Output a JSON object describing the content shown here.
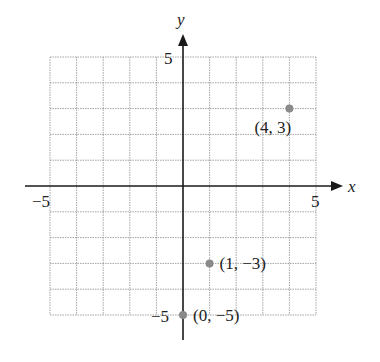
{
  "chart_data": {
    "type": "scatter",
    "title": "",
    "xlabel": "x",
    "ylabel": "y",
    "xlim": [
      -5,
      5
    ],
    "ylim": [
      -5,
      5
    ],
    "grid": true,
    "x_ticks_labeled": [
      "-5",
      "5"
    ],
    "y_ticks_labeled": [
      "5",
      "-5"
    ],
    "points": [
      {
        "x": 4,
        "y": 3,
        "label": "(4, 3)"
      },
      {
        "x": 1,
        "y": -3,
        "label": "(1, −3)"
      },
      {
        "x": 0,
        "y": -5,
        "label": "(0, −5)"
      }
    ]
  },
  "axes": {
    "x_label": "x",
    "y_label": "y",
    "x_min_label": "−5",
    "x_max_label": "5",
    "y_max_label": "5",
    "y_min_label": "−5"
  },
  "colors": {
    "axis": "#1a1a1a",
    "grid": "#9a9a9a",
    "point": "#8a8a8a",
    "text": "#222222"
  }
}
